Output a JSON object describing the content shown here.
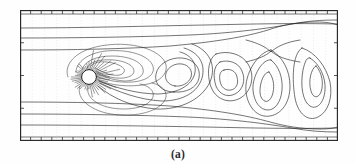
{
  "figure": {
    "caption": "(a)",
    "title": "",
    "type": "contour-plot",
    "frame": {
      "x": 0,
      "y": 0,
      "width": 318,
      "height": 131,
      "border_color": "#262626"
    },
    "axes": {
      "top_ticks": 30,
      "bottom_ticks": 30,
      "left_ticks": 4,
      "right_ticks": 4,
      "tick_color": "#3a3a3a",
      "tick_length": 3,
      "show_labels": false
    },
    "grid": {
      "enabled": true,
      "orientation": "vertical",
      "style": "dotted",
      "color": "#c9c9c9",
      "count": 26
    },
    "cylinder": {
      "label": "circular-cylinder",
      "cx": 69,
      "cy": 67,
      "r": 7.4,
      "fill": "#ffffff",
      "stroke": "#141414",
      "spokes": 44
    },
    "colors": {
      "contour_stroke": "#1f1f1f",
      "background": "#fefefe",
      "frame": "#262626",
      "grid": "#c9c9c9"
    }
  },
  "chart_data": {
    "type": "line",
    "title": "",
    "xlabel": "",
    "ylabel": "",
    "xlim": [
      0,
      318
    ],
    "ylim": [
      0,
      131
    ],
    "grid": true,
    "legend": null,
    "annotations": [
      {
        "name": "cylinder",
        "x": 69,
        "y": 67,
        "note": "circular cylinder cross-section"
      },
      {
        "name": "saddle-point",
        "x": 251,
        "y": 40,
        "note": "contour X-crossing in far wake"
      },
      {
        "name": "front-stagnation",
        "x": 48,
        "y": 67,
        "note": "upstream stagnation contour cusp"
      }
    ],
    "series": [
      {
        "name": "contour-top-1",
        "path": "M 0 4 L 318 4"
      },
      {
        "name": "contour-top-2",
        "path": "M 0 18 C 60 18, 130 16, 185 15 C 235 14, 270 13, 318 14"
      },
      {
        "name": "contour-top-3",
        "path": "M 0 28 C 55 28, 120 27, 170 25 C 215 23, 250 18, 272 14 C 288 11, 300 10, 318 10"
      },
      {
        "name": "contour-top-4",
        "path": "M 0 40 C 50 40, 105 39, 150 36 C 195 32, 225 27, 248 20 C 262 15, 278 12, 296 12 C 306 12, 312 13, 318 15"
      },
      {
        "name": "contour-up-lobe-1",
        "path": "M 48 67 C 44 57, 52 44, 72 38 C 96 31, 126 34, 140 46 C 152 56, 146 70, 128 74 C 110 78, 88 75, 78 70"
      },
      {
        "name": "contour-up-lobe-2",
        "path": "M 56 62 C 56 52, 68 43, 86 41 C 106 39, 126 44, 132 54 C 137 63, 128 71, 112 72 C 96 73, 82 69, 76 66"
      },
      {
        "name": "contour-up-lobe-3",
        "path": "M 62 60 C 64 51, 76 46, 92 46 C 108 46, 121 51, 123 59 C 125 66, 116 71, 104 71 C 92 70, 82 66, 77 63"
      },
      {
        "name": "contour-up-lobe-4",
        "path": "M 67 58 C 70 51, 81 49, 94 50 C 106 51, 114 56, 114 61 C 114 66, 106 69, 96 68 C 87 67, 80 64, 76 61"
      },
      {
        "name": "contour-up-lobe-5",
        "path": "M 71 56 C 75 51, 84 51, 93 53 C 101 55, 106 59, 104 62 C 102 66, 95 66, 88 64 C 82 62, 77 59, 75 58"
      },
      {
        "name": "contour-wake-1",
        "path": "M 79 71 C 96 78, 118 84, 138 84 C 158 83, 170 76, 174 66 C 178 55, 172 45, 160 42"
      },
      {
        "name": "contour-wake-2",
        "path": "M 80 73 C 98 82, 120 90, 142 91 C 163 91, 178 82, 182 68 C 186 53, 178 42, 164 38"
      },
      {
        "name": "contour-wake-3",
        "path": "M 78 76 C 92 88, 112 97, 136 99 C 161 100, 182 89, 190 72 C 197 55, 189 40, 172 34"
      },
      {
        "name": "contour-lower-lobe-1",
        "path": "M 60 76 C 56 86, 66 98, 86 103 C 108 108, 132 104, 142 94 C 150 86, 146 76, 132 73"
      },
      {
        "name": "contour-lower-lobe-2",
        "path": "M 68 78 C 66 86, 75 95, 92 98 C 110 101, 127 97, 132 89 C 136 82, 130 76, 120 74"
      },
      {
        "name": "contour-vortex-a-1",
        "path": "M 154 82 C 142 82, 134 74, 136 64 C 138 54, 150 47, 162 48 C 174 49, 181 58, 179 68 C 177 78, 166 83, 154 82 Z"
      },
      {
        "name": "contour-vortex-a-2",
        "path": "M 155 76 C 148 75, 144 69, 146 63 C 148 57, 155 53, 162 54 C 169 55, 173 61, 171 67 C 169 73, 162 77, 155 76 Z"
      },
      {
        "name": "contour-vortex-b-1",
        "path": "M 196 44 C 208 40, 222 44, 228 54 C 235 65, 232 80, 222 87 C 212 94, 199 91, 193 81 C 187 71, 186 50, 196 44 Z"
      },
      {
        "name": "contour-vortex-b-2",
        "path": "M 200 52 C 209 49, 219 53, 222 61 C 226 70, 223 80, 215 84 C 207 88, 199 84, 196 76 C 193 67, 193 56, 200 52 Z"
      },
      {
        "name": "contour-vortex-b-3",
        "path": "M 204 60 C 210 58, 216 61, 217 67 C 219 74, 216 79, 211 80 C 205 81, 201 77, 200 71 C 199 65, 200 61, 204 60 Z"
      },
      {
        "name": "contour-vortex-c-1",
        "path": "M 251 40 C 262 46, 270 60, 270 76 C 270 92, 262 104, 250 106 C 238 108, 228 98, 226 82 C 224 64, 238 42, 251 40 Z"
      },
      {
        "name": "contour-vortex-c-2",
        "path": "M 251 50 C 259 56, 263 68, 262 80 C 261 92, 255 100, 248 100 C 240 100, 234 92, 233 80 C 232 66, 243 48, 251 50 Z"
      },
      {
        "name": "contour-vortex-c-3",
        "path": "M 249 62 C 254 68, 255 78, 252 86 C 249 93, 244 93, 241 87 C 238 80, 242 62, 249 62 Z"
      },
      {
        "name": "contour-vortex-d-1",
        "path": "M 282 38 C 295 42, 306 56, 310 72 C 313 88, 308 102, 298 107 C 288 112, 278 104, 275 88 C 272 70, 272 44, 282 38 Z"
      },
      {
        "name": "contour-vortex-d-2",
        "path": "M 290 48 C 300 54, 306 68, 305 80 C 304 94, 296 100, 290 96 C 283 92, 280 76, 283 60 C 285 51, 287 47, 290 48 Z"
      },
      {
        "name": "contour-vortex-d-3",
        "path": "M 296 56 C 302 62, 304 74, 301 82 C 298 89, 293 88, 291 81 C 288 72, 291 58, 296 56 Z"
      },
      {
        "name": "contour-saddle-arm-1",
        "path": "M 226 30 C 238 33, 246 37, 251 42 C 256 37, 266 32, 280 30"
      },
      {
        "name": "contour-saddle-arm-2",
        "path": "M 226 52 C 238 49, 246 46, 251 41 C 256 46, 266 50, 280 52"
      },
      {
        "name": "contour-bot-1",
        "path": "M 0 92 C 50 92, 105 93, 150 96 C 195 100, 225 105, 250 112 C 265 116, 280 119, 300 119 C 310 119, 314 118, 318 117"
      },
      {
        "name": "contour-bot-2",
        "path": "M 0 104 C 55 104, 118 105, 168 107 C 212 109, 248 114, 272 118 C 288 121, 302 122, 318 122"
      },
      {
        "name": "contour-bot-3",
        "path": "M 0 115 C 60 115, 130 116, 185 117 C 235 118, 272 119, 318 118"
      },
      {
        "name": "contour-bot-4",
        "path": "M 0 127 L 318 127"
      }
    ]
  }
}
